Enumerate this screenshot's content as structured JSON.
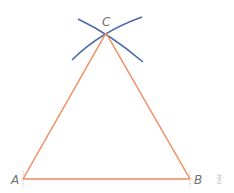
{
  "diagram": {
    "points": {
      "A": {
        "label": "A",
        "x": 23,
        "y": 179
      },
      "B": {
        "label": "B",
        "x": 190,
        "y": 179
      },
      "C": {
        "label": "C",
        "x": 106,
        "y": 33
      }
    },
    "colors": {
      "triangle": "#f08a5d",
      "arcs": "#4a6aaa",
      "labels": "#707070",
      "ticks": "#b0b0b0"
    },
    "watermark": "DAE"
  }
}
